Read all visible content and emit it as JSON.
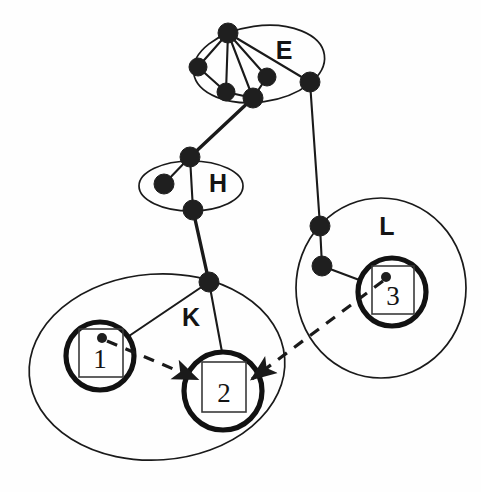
{
  "diagram": {
    "canvas": {
      "width": 481,
      "height": 492
    },
    "clusters": [
      {
        "id": "E",
        "label": "E",
        "label_x": 284,
        "label_y": 52,
        "shape": "ellipse",
        "cx": 259,
        "cy": 64,
        "rx": 66,
        "ry": 38,
        "rotation": -8
      },
      {
        "id": "H",
        "label": "H",
        "label_x": 218,
        "label_y": 185,
        "shape": "ellipse",
        "cx": 191,
        "cy": 186,
        "rx": 52,
        "ry": 25,
        "rotation": 0
      },
      {
        "id": "K",
        "label": "K",
        "label_x": 191,
        "label_y": 319,
        "shape": "ellipse",
        "cx": 157,
        "cy": 367,
        "rx": 128,
        "ry": 93,
        "rotation": -4
      },
      {
        "id": "L",
        "label": "L",
        "label_x": 387,
        "label_y": 228,
        "shape": "ellipse",
        "cx": 381,
        "cy": 288,
        "rx": 85,
        "ry": 90,
        "rotation": 0
      }
    ],
    "nodes": [
      {
        "id": "e1",
        "cluster": "E",
        "x": 228,
        "y": 33,
        "r": 10
      },
      {
        "id": "e2",
        "cluster": "E",
        "x": 198,
        "y": 67,
        "r": 9
      },
      {
        "id": "e3",
        "cluster": "E",
        "x": 226,
        "y": 92,
        "r": 9
      },
      {
        "id": "e4",
        "cluster": "E",
        "x": 253,
        "y": 98,
        "r": 10
      },
      {
        "id": "e5",
        "cluster": "E",
        "x": 267,
        "y": 77,
        "r": 9
      },
      {
        "id": "e6",
        "cluster": "E",
        "x": 310,
        "y": 82,
        "r": 10
      },
      {
        "id": "h1",
        "cluster": "H",
        "x": 190,
        "y": 157,
        "r": 10
      },
      {
        "id": "h2",
        "cluster": "H",
        "x": 164,
        "y": 184,
        "r": 10
      },
      {
        "id": "h3",
        "cluster": "H",
        "x": 193,
        "y": 210,
        "r": 10
      },
      {
        "id": "k0",
        "cluster": "K",
        "x": 209,
        "y": 282,
        "r": 10
      },
      {
        "id": "l1",
        "cluster": "L",
        "x": 320,
        "y": 226,
        "r": 10
      },
      {
        "id": "l2",
        "cluster": "L",
        "x": 322,
        "y": 266,
        "r": 10
      }
    ],
    "edges": [
      {
        "from": "e1",
        "to": "e2",
        "style": "solid"
      },
      {
        "from": "e1",
        "to": "e3",
        "style": "solid"
      },
      {
        "from": "e1",
        "to": "e4",
        "style": "solid"
      },
      {
        "from": "e1",
        "to": "e5",
        "style": "solid"
      },
      {
        "from": "e1",
        "to": "e6",
        "style": "solid"
      },
      {
        "from": "e2",
        "to": "e3",
        "style": "solid"
      },
      {
        "from": "e3",
        "to": "e4",
        "style": "solid"
      },
      {
        "from": "e4",
        "to": "e5",
        "style": "solid"
      },
      {
        "from": "e4",
        "to": "h1",
        "style": "solid"
      },
      {
        "from": "e6",
        "to": "l1",
        "style": "solid"
      },
      {
        "from": "h1",
        "to": "h2",
        "style": "solid"
      },
      {
        "from": "h1",
        "to": "h3",
        "style": "solid"
      },
      {
        "from": "h3",
        "to": "k0",
        "style": "solid"
      },
      {
        "from": "l1",
        "to": "l2",
        "style": "solid"
      }
    ],
    "agents": [
      {
        "id": "agent1",
        "label": "1",
        "cluster": "K",
        "cx": 100,
        "cy": 356,
        "r": 34,
        "box": {
          "x": 79,
          "y": 329,
          "w": 44,
          "h": 48
        },
        "dot": {
          "x": 102,
          "y": 338,
          "r": 5
        }
      },
      {
        "id": "agent2",
        "label": "2",
        "cluster": "K",
        "cx": 223,
        "cy": 391,
        "r": 39,
        "box": {
          "x": 202,
          "y": 362,
          "w": 44,
          "h": 50
        },
        "dot": null
      },
      {
        "id": "agent3",
        "label": "3",
        "cluster": "L",
        "cx": 392,
        "cy": 292,
        "r": 34,
        "box": {
          "x": 372,
          "y": 266,
          "w": 42,
          "h": 48
        },
        "dot": {
          "x": 386,
          "y": 277,
          "r": 5
        }
      }
    ],
    "cluster_links": [
      {
        "from_node": "k0",
        "to_agent": "agent1"
      },
      {
        "from_node": "k0",
        "to_agent": "agent2"
      },
      {
        "from_node": "l2",
        "to_agent": "agent3"
      }
    ],
    "message_arrows": [
      {
        "id": "msg-1-to-2",
        "from_agent": "agent1",
        "to_agent": "agent2",
        "x1": 107,
        "y1": 341,
        "x2": 197,
        "y2": 379,
        "style": "dashed",
        "arrowhead": "end"
      },
      {
        "id": "msg-3-to-2",
        "from_agent": "agent3",
        "to_agent": "agent2",
        "x1": 383,
        "y1": 281,
        "x2": 252,
        "y2": 379,
        "style": "dashed",
        "arrowhead": "end"
      }
    ],
    "colors": {
      "ink": "#1a1a1a",
      "background": "#ffffff",
      "node_fill": "#1f1f1f",
      "ring_stroke": "#121212",
      "box_stroke": "#3a3a3a"
    }
  }
}
